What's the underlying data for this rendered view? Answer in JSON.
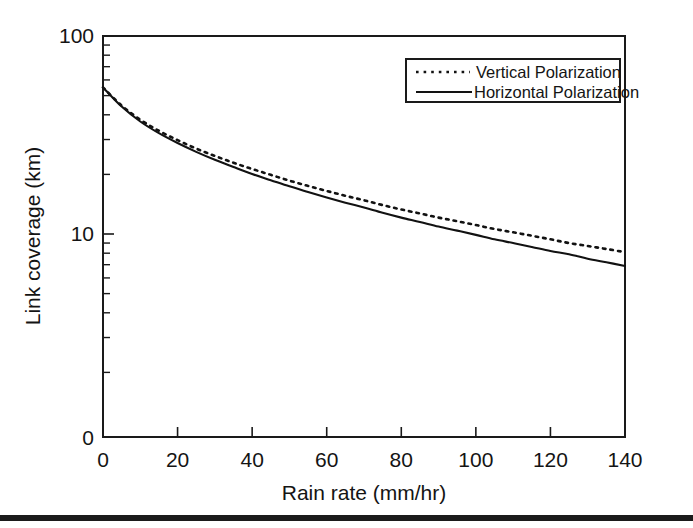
{
  "figure": {
    "background_color": "#ffffff",
    "ink_color": "#121212",
    "bottom_rule": {
      "name": "page-bottom-rule",
      "color": "#1b1b1b"
    }
  },
  "chart_data": {
    "type": "line",
    "title": "",
    "xlabel": "Rain rate (mm/hr)",
    "ylabel": "Link coverage (km)",
    "xscale": "linear",
    "yscale": "log",
    "xlim": [
      0,
      140
    ],
    "ylim": [
      1,
      100
    ],
    "grid": false,
    "legend_position": "top-right",
    "xticks": [
      0,
      20,
      40,
      60,
      80,
      100,
      120,
      140
    ],
    "xtick_labels": [
      "0",
      "20",
      "40",
      "60",
      "80",
      "100",
      "120",
      "140"
    ],
    "yticks": [
      100,
      10
    ],
    "ytick_labels": [
      "100",
      "10"
    ],
    "y_origin_label": "0",
    "y_minor_ticks": [
      90,
      80,
      70,
      60,
      50,
      40,
      30,
      20,
      9,
      8,
      7,
      6,
      5,
      4,
      3,
      2
    ],
    "x": [
      0,
      5,
      10,
      15,
      20,
      25,
      30,
      35,
      40,
      45,
      50,
      55,
      60,
      65,
      70,
      75,
      80,
      85,
      90,
      95,
      100,
      105,
      110,
      115,
      120,
      125,
      130,
      135,
      140
    ],
    "series": [
      {
        "name": "Vertical Polarization",
        "style": "dotted",
        "color": "#121212",
        "values": [
          55.0,
          44.5,
          37.8,
          33.2,
          29.8,
          27.0,
          24.8,
          22.9,
          21.3,
          19.9,
          18.6,
          17.5,
          16.5,
          15.6,
          14.8,
          14.0,
          13.3,
          12.7,
          12.1,
          11.6,
          11.1,
          10.6,
          10.2,
          9.8,
          9.4,
          9.0,
          8.7,
          8.4,
          8.1
        ]
      },
      {
        "name": "Horizontal Polarization",
        "style": "solid",
        "color": "#121212",
        "values": [
          55.0,
          44.0,
          37.0,
          32.3,
          28.8,
          26.0,
          23.7,
          21.8,
          20.1,
          18.7,
          17.4,
          16.3,
          15.3,
          14.4,
          13.6,
          12.8,
          12.1,
          11.5,
          10.9,
          10.4,
          9.9,
          9.4,
          9.0,
          8.6,
          8.2,
          7.9,
          7.5,
          7.2,
          6.9
        ]
      }
    ],
    "legend_entries": [
      {
        "label": "Vertical Polarization",
        "style": "dotted"
      },
      {
        "label": "Horizontal Polarization",
        "style": "solid"
      }
    ]
  }
}
